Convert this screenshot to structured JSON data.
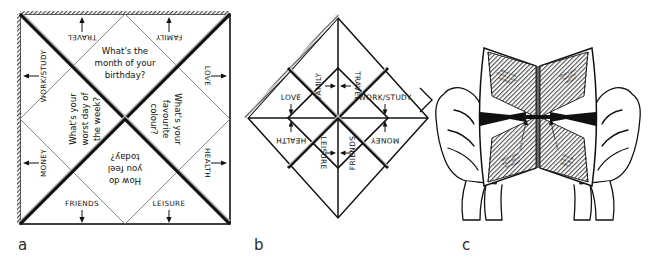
{
  "figure": {
    "type": "instructional-diagram",
    "panels": [
      {
        "id": "a",
        "label": "a"
      },
      {
        "id": "b",
        "label": "b"
      },
      {
        "id": "c",
        "label": "c"
      }
    ]
  },
  "panel_a": {
    "questions": {
      "top": "What's the month of your birthday?",
      "left": "What's your worst day of the week?",
      "right": "What's your favourite colour?",
      "bottom": "How do you feel today?"
    },
    "categories": {
      "top_left": "TRAVEL",
      "top_right": "FAMILY",
      "left_top": "WORK/STUDY",
      "right_top": "LOVE",
      "left_bottom": "MONEY",
      "right_bottom": "HEALTH",
      "bottom_left": "FRIENDS",
      "bottom_right": "LEISURE"
    }
  },
  "panel_b": {
    "categories": {
      "top_left": "FAMILY",
      "top_right": "TRAVEL",
      "right_upper": "WORK/STUDY",
      "right_lower": "MONEY",
      "left_upper": "LOVE",
      "left_lower": "HEALTH",
      "bottom_left": "LEISURE",
      "bottom_right": "FRIENDS"
    }
  },
  "panel_c": {
    "caption_hint": "hands holding the folded fortune teller, opened along a horizontal double arrow",
    "flap_texts": [
      "What's the month of your birthday?",
      "What's your favourite colour?",
      "What's your worst day of the week?",
      "How do you feel today?"
    ],
    "inner_labels": [
      "TRAVEL",
      "FAMILY"
    ]
  },
  "colors": {
    "ink": "#111111",
    "hatch": "#555555",
    "paper": "#ffffff"
  }
}
